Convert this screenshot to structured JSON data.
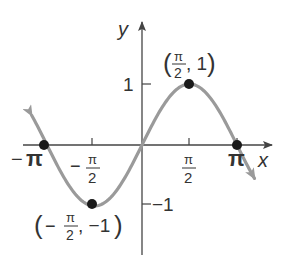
{
  "chart_data": {
    "type": "line",
    "title": "",
    "function": "y = sin x",
    "xlabel": "x",
    "ylabel": "y",
    "xlim": [
      -3.6,
      4.0
    ],
    "ylim": [
      -1.4,
      1.5
    ],
    "grid": false,
    "legend": null,
    "x_ticks": [
      {
        "value": -3.14159,
        "label_num": "π",
        "label_sign": "−",
        "fraction": false
      },
      {
        "value": -1.5708,
        "label_num": "π",
        "label_den": "2",
        "label_sign": "−",
        "fraction": true
      },
      {
        "value": 1.5708,
        "label_num": "π",
        "label_den": "2",
        "label_sign": "",
        "fraction": true
      },
      {
        "value": 3.14159,
        "label_num": "π",
        "label_sign": "",
        "fraction": false
      }
    ],
    "y_ticks": [
      {
        "value": 1,
        "label": "1"
      },
      {
        "value": -1,
        "label": "−1"
      }
    ],
    "series": [
      {
        "name": "sin x",
        "color": "#9a9a9a",
        "x": [
          -3.6,
          -3.14159,
          -2.3562,
          -1.5708,
          -0.7854,
          0,
          0.7854,
          1.5708,
          2.3562,
          3.14159,
          3.7
        ],
        "y": [
          0.4425,
          0,
          -0.7071,
          -1,
          -0.7071,
          0,
          0.7071,
          1,
          0.7071,
          0,
          -0.5298
        ]
      }
    ],
    "points": [
      {
        "x": -3.14159,
        "y": 0,
        "label": ""
      },
      {
        "x": -1.5708,
        "y": -1,
        "label": "(−π/2, −1)"
      },
      {
        "x": 1.5708,
        "y": 1,
        "label": "(π/2, 1)"
      },
      {
        "x": 3.14159,
        "y": 0,
        "label": ""
      }
    ],
    "annotations": {
      "max_point": {
        "open": "(",
        "num": "π",
        "den": "2",
        "rest": ", 1",
        "close": ")"
      },
      "min_point": {
        "open": "(",
        "sign": "−",
        "num": "π",
        "den": "2",
        "rest": ", −1",
        "close": ")"
      }
    }
  },
  "axes": {
    "x_label": "x",
    "y_label": "y",
    "tick_neg_pi": {
      "sign": "−",
      "sym": "π"
    },
    "tick_neg_half_pi": {
      "sign": "−",
      "num": "π",
      "den": "2"
    },
    "tick_half_pi": {
      "num": "π",
      "den": "2"
    },
    "tick_pi": {
      "sym": "π"
    },
    "tick_y1": "1",
    "tick_ym1": "−1"
  },
  "colors": {
    "curve": "#9a9a9a",
    "axis": "#444444",
    "point": "#1a1a1a",
    "text": "#333333"
  }
}
